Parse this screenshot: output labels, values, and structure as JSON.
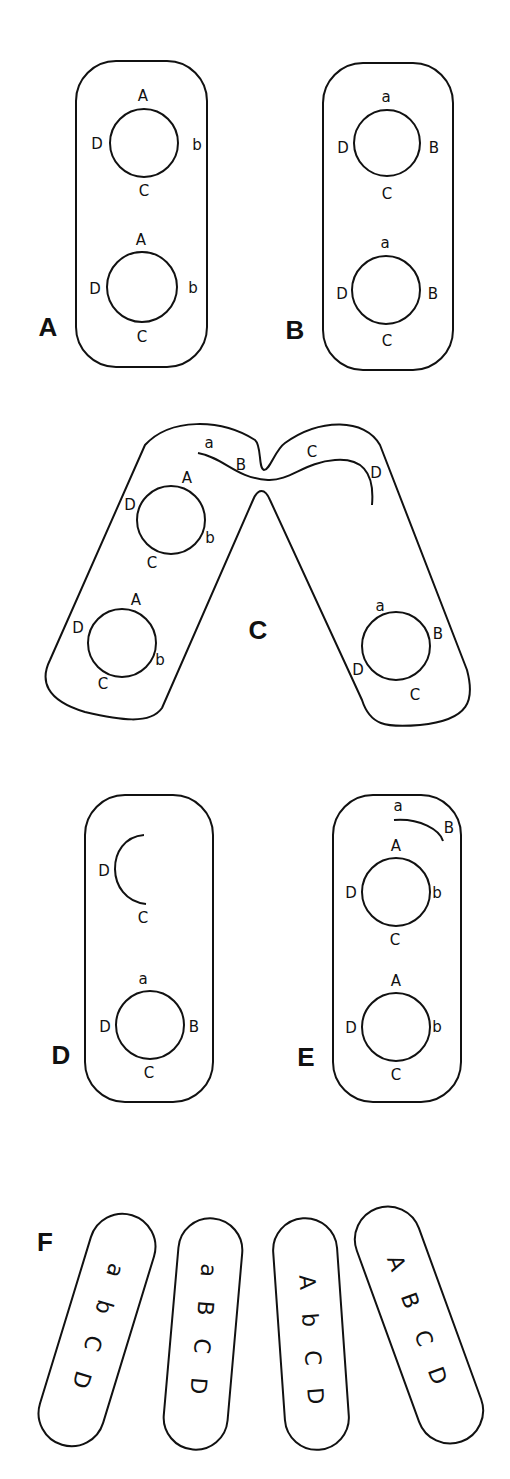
{
  "figure": {
    "panels": {
      "A": {
        "label": "A",
        "plasmids": [
          {
            "top": "A",
            "right": "b",
            "bottom": "C",
            "left": "D"
          },
          {
            "top": "A",
            "right": "b",
            "bottom": "C",
            "left": "D"
          }
        ]
      },
      "B": {
        "label": "B",
        "plasmids": [
          {
            "top": "a",
            "right": "B",
            "bottom": "C",
            "left": "D"
          },
          {
            "top": "a",
            "right": "B",
            "bottom": "C",
            "left": "D"
          }
        ]
      },
      "C": {
        "label": "C",
        "left_cell_plasmids": [
          {
            "top": "A",
            "right": "b",
            "bottom": "C",
            "left": "D"
          },
          {
            "top": "A",
            "right": "b",
            "bottom": "C",
            "left": "D"
          }
        ],
        "transfer_strand": [
          "a",
          "B",
          "C",
          "D"
        ],
        "right_cell_plasmid": {
          "top": "a",
          "right": "B",
          "bottom": "C",
          "left": "D"
        }
      },
      "D": {
        "label": "D",
        "fragment": {
          "top": "D",
          "bottom": "C"
        },
        "plasmid": {
          "top": "a",
          "right": "B",
          "bottom": "C",
          "left": "D"
        }
      },
      "E": {
        "label": "E",
        "fragment": {
          "start": "a",
          "end": "B"
        },
        "plasmids": [
          {
            "top": "A",
            "right": "b",
            "bottom": "C",
            "left": "D"
          },
          {
            "top": "A",
            "right": "b",
            "bottom": "C",
            "left": "D"
          }
        ]
      },
      "F": {
        "label": "F",
        "cells": [
          {
            "genes": [
              "a",
              "b",
              "C",
              "D"
            ]
          },
          {
            "genes": [
              "a",
              "B",
              "C",
              "D"
            ]
          },
          {
            "genes": [
              "A",
              "b",
              "C",
              "D"
            ]
          },
          {
            "genes": [
              "A",
              "B",
              "C",
              "D"
            ]
          }
        ]
      }
    }
  }
}
